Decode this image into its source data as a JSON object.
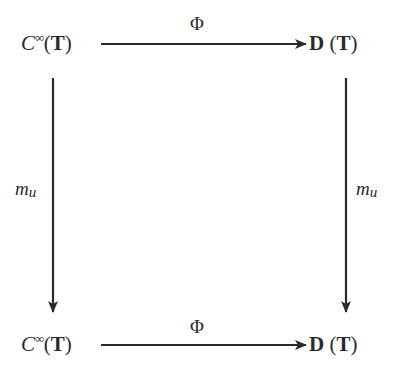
{
  "diagram": {
    "type": "commutative-square",
    "nodes": {
      "top_left": {
        "base": "C",
        "superscript": "∞",
        "open": "(",
        "arg": "T",
        "close": ")"
      },
      "top_right": {
        "base": "D",
        "open": " (",
        "arg": "T",
        "close": ")"
      },
      "bottom_left": {
        "base": "C",
        "superscript": "∞",
        "open": "(",
        "arg": "T",
        "close": ")"
      },
      "bottom_right": {
        "base": "D",
        "open": " (",
        "arg": "T",
        "close": ")"
      }
    },
    "arrows": {
      "top": {
        "from": "C∞(T)",
        "to": "D(T)",
        "label": "Φ"
      },
      "bottom": {
        "from": "C∞(T)",
        "to": "D(T)",
        "label": "Φ"
      },
      "left": {
        "from": "C∞(T)",
        "to": "C∞(T)",
        "label_base": "m",
        "label_sub": "u"
      },
      "right": {
        "from": "D(T)",
        "to": "D(T)",
        "label_base": "m",
        "label_sub": "u"
      }
    },
    "colors": {
      "ink": "#2a2a2a",
      "background": "#ffffff"
    }
  }
}
